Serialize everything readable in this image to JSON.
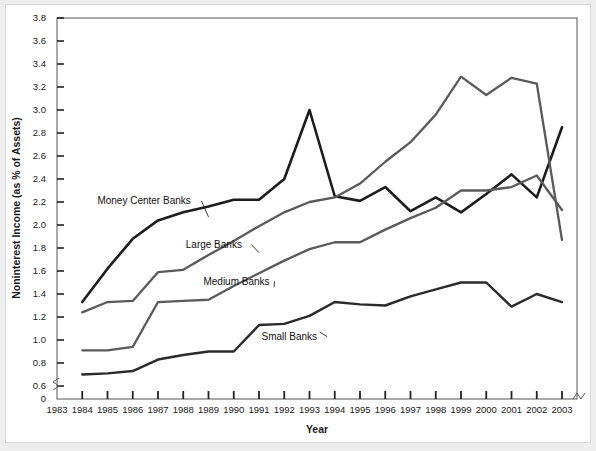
{
  "chart_data": {
    "type": "line",
    "title": "",
    "xlabel": "Year",
    "ylabel": "Noninterest Income (as % of Assets)",
    "x": [
      1984,
      1985,
      1986,
      1987,
      1988,
      1989,
      1990,
      1991,
      1992,
      1993,
      1994,
      1995,
      1996,
      1997,
      1998,
      1999,
      2000,
      2001,
      2002,
      2003
    ],
    "xlim": [
      1983,
      2003
    ],
    "ylim": [
      0.6,
      3.8
    ],
    "y_axis_break": true,
    "y_ticks": [
      "0",
      "0.6",
      "0.8",
      "1.0",
      "1.2",
      "1.4",
      "1.6",
      "1.8",
      "2.0",
      "2.2",
      "2.4",
      "2.6",
      "2.8",
      "3.0",
      "3.2",
      "3.4",
      "3.6",
      "3.8"
    ],
    "x_ticks": [
      "1983",
      "1984",
      "1985",
      "1986",
      "1987",
      "1988",
      "1989",
      "1990",
      "1991",
      "1992",
      "1993",
      "1994",
      "1995",
      "1996",
      "1997",
      "1998",
      "1999",
      "2000",
      "2001",
      "2002",
      "2003"
    ],
    "grid": false,
    "legend_position": "inline-annotations",
    "series": [
      {
        "name": "Money Center Banks",
        "color": "#1c1c1c",
        "width": 2.6,
        "label_x": 1984.6,
        "label_y": 2.21,
        "leader_to_x": 1989.0,
        "leader_to_y": 2.07,
        "values": [
          1.33,
          1.62,
          1.88,
          2.04,
          2.11,
          2.16,
          2.22,
          2.22,
          2.4,
          3.0,
          2.25,
          2.21,
          2.33,
          2.12,
          2.24,
          2.11,
          2.27,
          2.44,
          2.24,
          2.85
        ]
      },
      {
        "name": "Large Banks",
        "color": "#5a5a5a",
        "width": 2.3,
        "label_x": 1988.1,
        "label_y": 1.83,
        "leader_to_x": 1991.0,
        "leader_to_y": 1.76,
        "values": [
          1.24,
          1.33,
          1.34,
          1.59,
          1.61,
          1.74,
          1.86,
          1.99,
          2.11,
          2.2,
          2.24,
          2.36,
          2.55,
          2.72,
          2.96,
          3.29,
          3.13,
          3.28,
          3.23,
          1.87
        ]
      },
      {
        "name": "Medium Banks",
        "color": "#5a5a5a",
        "width": 2.3,
        "label_x": 1988.8,
        "label_y": 1.51,
        "leader_to_x": 1991.6,
        "leader_to_y": 1.46,
        "values": [
          0.91,
          0.91,
          0.94,
          1.33,
          1.34,
          1.35,
          1.47,
          1.58,
          1.69,
          1.79,
          1.85,
          1.85,
          1.96,
          2.06,
          2.15,
          2.3,
          2.3,
          2.33,
          2.43,
          2.13
        ]
      },
      {
        "name": "Small Banks",
        "color": "#2a2a2a",
        "width": 2.4,
        "label_x": 1991.1,
        "label_y": 1.03,
        "leader_to_x": 1993.4,
        "leader_to_y": 1.07,
        "values": [
          0.7,
          0.71,
          0.73,
          0.83,
          0.87,
          0.9,
          0.9,
          1.13,
          1.14,
          1.21,
          1.33,
          1.31,
          1.3,
          1.38,
          1.44,
          1.5,
          1.5,
          1.29,
          1.4,
          1.33
        ]
      }
    ]
  }
}
